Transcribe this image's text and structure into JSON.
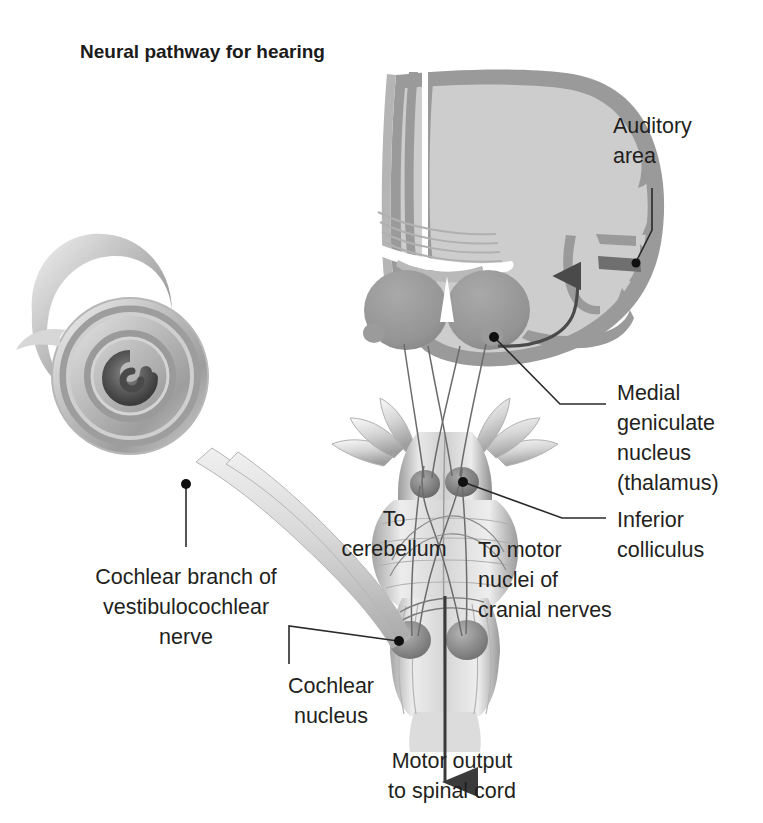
{
  "figure": {
    "title": "Neural pathway for hearing",
    "background_color": "#ffffff",
    "text_color": "#231f20",
    "leader_color": "#2a2a2a"
  },
  "palette": {
    "cortex_fill": "#cdcdcd",
    "cortex_ribbon": "#9a9a9a",
    "nucleus_dark": "#8e8e8e",
    "auditory_band": "#6f6f6f",
    "brainstem_light": "#e6e6e6",
    "brainstem_mid": "#b9b9b9",
    "brainstem_dark": "#7d7d7d",
    "cochlea_light": "#dcdcdc",
    "cochlea_mid": "#a8a8a8",
    "cochlea_dark": "#5e5e5e",
    "nerve_fill": "#d2d2d2"
  },
  "labels": [
    {
      "id": "auditory-area",
      "lines": [
        "Auditory",
        "area"
      ],
      "x": 613,
      "y": 133,
      "align": "start",
      "line_height": 30
    },
    {
      "id": "medial-geniculate-nucleus",
      "lines": [
        "Medial",
        "geniculate",
        "nucleus",
        "(thalamus)"
      ],
      "x": 617,
      "y": 400,
      "align": "start",
      "line_height": 30
    },
    {
      "id": "inferior-colliculus",
      "lines": [
        "Inferior",
        "colliculus"
      ],
      "x": 617,
      "y": 527,
      "align": "start",
      "line_height": 30
    },
    {
      "id": "cochlear-branch-of-vestibulocochlear-nerve",
      "lines": [
        "Cochlear branch of",
        "vestibulocochlear",
        "nerve"
      ],
      "x": 186,
      "y": 584,
      "align": "middle",
      "line_height": 30
    },
    {
      "id": "to-cerebellum",
      "lines": [
        "To",
        "cerebellum"
      ],
      "x": 394,
      "y": 526,
      "align": "middle",
      "line_height": 30
    },
    {
      "id": "to-motor-nuclei-of-cranial-nerves",
      "lines": [
        "To motor",
        "nuclei of",
        "cranial nerves"
      ],
      "x": 478,
      "y": 557,
      "align": "start",
      "line_height": 30
    },
    {
      "id": "cochlear-nucleus",
      "lines": [
        "Cochlear",
        "nucleus"
      ],
      "x": 331,
      "y": 693,
      "align": "middle",
      "line_height": 30
    },
    {
      "id": "motor-output-to-spinal-cord",
      "lines": [
        "Motor output",
        "to spinal cord"
      ],
      "x": 452,
      "y": 768,
      "align": "middle",
      "line_height": 30
    }
  ],
  "structures": [
    {
      "id": "cochlea",
      "name": "Cochlea"
    },
    {
      "id": "vestibulocochlear-nerve",
      "name": "Vestibulocochlear nerve"
    },
    {
      "id": "cerebrum",
      "name": "Cerebrum coronal section"
    },
    {
      "id": "auditory-cortex-band",
      "name": "Auditory area band"
    },
    {
      "id": "thalamus-nuclei",
      "name": "Medial geniculate nuclei"
    },
    {
      "id": "brainstem",
      "name": "Brainstem"
    },
    {
      "id": "inferior-colliculi",
      "name": "Inferior colliculi"
    },
    {
      "id": "cochlear-nuclei",
      "name": "Cochlear nuclei"
    },
    {
      "id": "spinal-cord-arrow",
      "name": "Motor output arrow"
    }
  ]
}
